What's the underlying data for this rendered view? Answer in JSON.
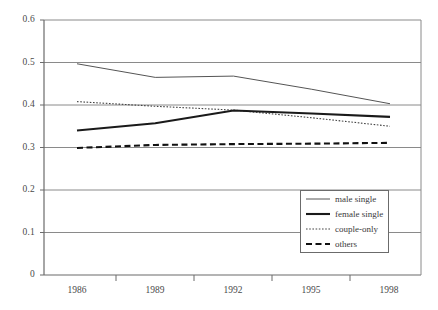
{
  "chart_data": {
    "type": "line",
    "title": "",
    "xlabel": "",
    "ylabel": "",
    "x": [
      1986,
      1989,
      1992,
      1995,
      1998
    ],
    "categories": [
      "1986",
      "1989",
      "1992",
      "1995",
      "1998"
    ],
    "ylim": [
      0,
      0.6
    ],
    "yticks": [
      0,
      0.1,
      0.2,
      0.3,
      0.4,
      0.5,
      0.6
    ],
    "ytick_labels": [
      "0",
      "0.1",
      "0.2",
      "0.3",
      "0.4",
      "0.5",
      "0.6"
    ],
    "grid": "horizontal",
    "legend_position": "bottom-right",
    "series": [
      {
        "name": "male single",
        "style": "solid-thin",
        "color": "#555555",
        "values": [
          0.497,
          0.465,
          0.468,
          0.437,
          0.403
        ]
      },
      {
        "name": "female single",
        "style": "solid-thick",
        "color": "#1a1a1a",
        "values": [
          0.34,
          0.357,
          0.387,
          0.38,
          0.372
        ]
      },
      {
        "name": "couple-only",
        "style": "dotted",
        "color": "#444444",
        "values": [
          0.408,
          0.397,
          0.388,
          0.37,
          0.35
        ]
      },
      {
        "name": "others",
        "style": "dashed",
        "color": "#111111",
        "values": [
          0.299,
          0.306,
          0.308,
          0.309,
          0.311
        ]
      }
    ]
  },
  "axes": {
    "ytick_labels": [
      "0.6",
      "0.5",
      "0.4",
      "0.3",
      "0.2",
      "0.1",
      "0"
    ],
    "xtick_labels": [
      "1986",
      "1989",
      "1992",
      "1995",
      "1998"
    ]
  },
  "legend": {
    "items": [
      {
        "label": "male single"
      },
      {
        "label": "female single"
      },
      {
        "label": "couple-only"
      },
      {
        "label": "others"
      }
    ]
  },
  "colors": {
    "axis": "#6b6b6b",
    "grid": "#8a8a8a",
    "text": "#3a3a3a",
    "background": "#ffffff"
  }
}
